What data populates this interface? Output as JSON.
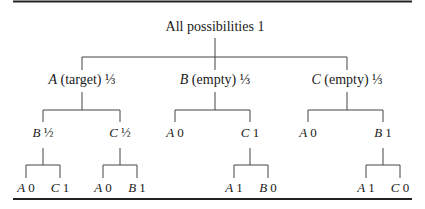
{
  "diagram": {
    "type": "probability-tree",
    "root": {
      "label": "All possibilities",
      "prob": "1"
    },
    "level1": [
      {
        "var": "A",
        "desc": "(target)",
        "prob": "⅓"
      },
      {
        "var": "B",
        "desc": "(empty)",
        "prob": "⅓"
      },
      {
        "var": "C",
        "desc": "(empty)",
        "prob": "⅓"
      }
    ],
    "level2": [
      {
        "parent": "A",
        "var": "B",
        "prob": "½"
      },
      {
        "parent": "A",
        "var": "C",
        "prob": "½"
      },
      {
        "parent": "B",
        "var": "A",
        "prob": "0"
      },
      {
        "parent": "B",
        "var": "C",
        "prob": "1"
      },
      {
        "parent": "C",
        "var": "A",
        "prob": "0"
      },
      {
        "parent": "C",
        "var": "B",
        "prob": "1"
      }
    ],
    "level3": [
      {
        "parent": "A/B",
        "var": "A",
        "prob": "0"
      },
      {
        "parent": "A/B",
        "var": "C",
        "prob": "1"
      },
      {
        "parent": "A/C",
        "var": "A",
        "prob": "0"
      },
      {
        "parent": "A/C",
        "var": "B",
        "prob": "1"
      },
      {
        "parent": "B/C",
        "var": "A",
        "prob": "1"
      },
      {
        "parent": "B/C",
        "var": "B",
        "prob": "0"
      },
      {
        "parent": "C/B",
        "var": "A",
        "prob": "1"
      },
      {
        "parent": "C/B",
        "var": "C",
        "prob": "0"
      }
    ]
  },
  "colors": {
    "line": "#444444",
    "rule": "#222222",
    "text": "#1a1a1a"
  }
}
